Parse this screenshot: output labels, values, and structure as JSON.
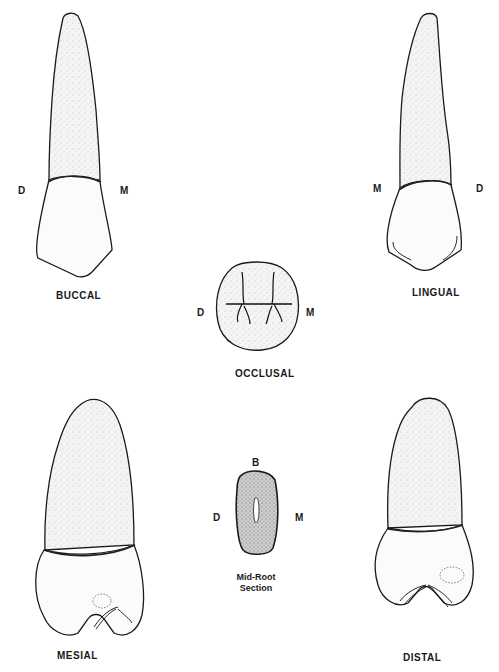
{
  "views": {
    "buccal": {
      "label": "BUCCAL",
      "left_mark": "D",
      "right_mark": "M"
    },
    "lingual": {
      "label": "LINGUAL",
      "left_mark": "M",
      "right_mark": "D"
    },
    "occlusal": {
      "label": "OCCLUSAL",
      "left_mark": "D",
      "right_mark": "M"
    },
    "mid_root": {
      "label_line1": "Mid-Root",
      "label_line2": "Section",
      "top_mark": "B",
      "left_mark": "D",
      "right_mark": "M"
    },
    "mesial": {
      "label": "MESIAL"
    },
    "distal": {
      "label": "DISTAL"
    }
  },
  "colors": {
    "ink": "#1a1a1a",
    "paper": "#ffffff"
  }
}
